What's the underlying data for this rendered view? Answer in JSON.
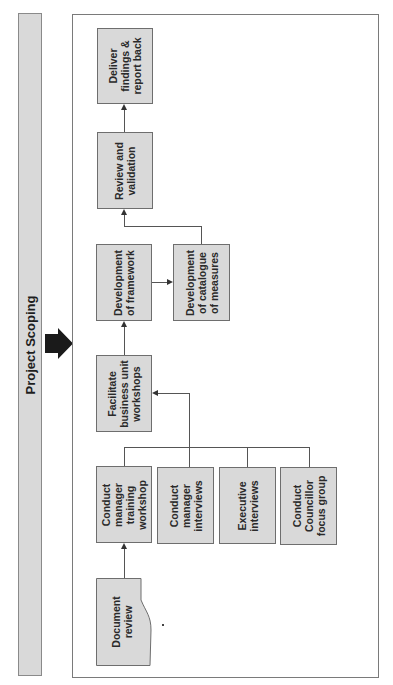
{
  "banner": {
    "label": "Project Scoping"
  },
  "colors": {
    "box_fill": "#d9d9d9",
    "box_border": "#6e6e6e",
    "line": "#555555",
    "arrow": "#1a1a1a"
  },
  "diagram": {
    "boxes": {
      "deliver": "Deliver\nfindings &\nreport back",
      "review": "Review and\nvalidation",
      "framework": "Development\nof framework",
      "catalogue": "Development\nof catalogue\nof measures",
      "facilitate": "Facilitate\nbusiness unit\nworkshops",
      "training": "Conduct\nmanager\ntraining\nworkshop",
      "manager_interviews": "Conduct\nmanager\ninterviews",
      "executive_interviews": "Executive\ninterviews",
      "councillor_focus": "Conduct\nCouncillor\nfocus group",
      "document_review": "Document\nreview"
    },
    "flow": [
      "Document review -> Conduct manager training workshop",
      "Conduct manager training workshop / Conduct manager interviews / Executive interviews / Conduct Councillor focus group -> Facilitate business unit workshops",
      "Facilitate business unit workshops -> Development of framework",
      "Development of framework -> Development of catalogue of measures",
      "Development of catalogue of measures -> Review and validation",
      "Review and validation -> Deliver findings & report back"
    ]
  }
}
